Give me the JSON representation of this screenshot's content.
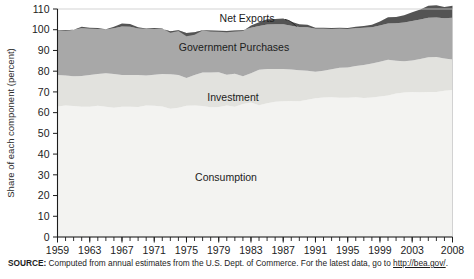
{
  "chart_data": {
    "type": "area",
    "title": "",
    "subtitle": "",
    "xlabel": "",
    "ylabel": "Share of each component (percent)",
    "ylim": [
      0,
      110
    ],
    "yticks": [
      0,
      10,
      20,
      30,
      40,
      50,
      60,
      70,
      80,
      90,
      100,
      110
    ],
    "xlim": [
      1959,
      2008
    ],
    "xticks": [
      1959,
      1963,
      1967,
      1971,
      1975,
      1979,
      1983,
      1987,
      1991,
      1995,
      1999,
      2003,
      2008
    ],
    "minor_tick_interval": 1,
    "grid": false,
    "legend_position": "inline-labels",
    "stacked": true,
    "annotations": [
      {
        "text": "Net Exports",
        "series": "Net Exports"
      },
      {
        "text": "Government Purchases",
        "series": "Government Purchases"
      },
      {
        "text": "Investment",
        "series": "Investment"
      },
      {
        "text": "Consumption",
        "series": "Consumption"
      }
    ],
    "x": [
      1959,
      1960,
      1961,
      1962,
      1963,
      1964,
      1965,
      1966,
      1967,
      1968,
      1969,
      1970,
      1971,
      1972,
      1973,
      1974,
      1975,
      1976,
      1977,
      1978,
      1979,
      1980,
      1981,
      1982,
      1983,
      1984,
      1985,
      1986,
      1987,
      1988,
      1989,
      1990,
      1991,
      1992,
      1993,
      1994,
      1995,
      1996,
      1997,
      1998,
      1999,
      2000,
      2001,
      2002,
      2003,
      2004,
      2005,
      2006,
      2007,
      2008
    ],
    "series": [
      {
        "name": "Consumption",
        "color": "#f3f3f1",
        "values": [
          63.0,
          63.4,
          63.2,
          62.8,
          62.9,
          63.3,
          62.8,
          62.3,
          62.8,
          62.9,
          62.7,
          63.4,
          63.3,
          63.0,
          61.9,
          62.3,
          63.3,
          63.5,
          63.2,
          62.6,
          62.7,
          63.4,
          62.8,
          64.2,
          64.9,
          63.6,
          64.5,
          65.3,
          65.5,
          65.6,
          65.5,
          66.2,
          67.0,
          67.3,
          67.4,
          67.2,
          67.2,
          67.4,
          67.1,
          67.3,
          67.8,
          68.3,
          69.2,
          69.7,
          69.9,
          69.8,
          69.9,
          69.9,
          70.5,
          70.9
        ]
      },
      {
        "name": "Investment",
        "color": "#e2e2de",
        "values": [
          15.2,
          14.5,
          14.3,
          14.9,
          15.2,
          15.4,
          16.2,
          16.4,
          15.4,
          15.3,
          15.5,
          14.5,
          15.0,
          15.7,
          16.6,
          15.8,
          13.4,
          14.6,
          16.2,
          16.8,
          16.8,
          14.9,
          16.0,
          13.4,
          14.1,
          17.1,
          16.5,
          15.8,
          15.6,
          15.2,
          15.0,
          14.0,
          12.7,
          12.9,
          13.5,
          14.4,
          14.6,
          15.1,
          15.9,
          16.4,
          16.7,
          17.2,
          15.8,
          15.1,
          15.3,
          16.1,
          16.8,
          16.9,
          15.6,
          14.7
        ]
      },
      {
        "name": "Government Purchases",
        "color": "#a8a8a8",
        "values": [
          21.6,
          21.8,
          22.5,
          23.0,
          22.4,
          21.7,
          21.1,
          22.0,
          23.3,
          23.2,
          22.4,
          22.4,
          22.1,
          21.6,
          20.8,
          21.6,
          21.7,
          20.7,
          20.4,
          20.2,
          20.0,
          21.1,
          20.8,
          22.1,
          22.0,
          21.1,
          21.5,
          21.5,
          21.6,
          21.1,
          20.8,
          21.0,
          20.8,
          20.3,
          19.5,
          18.9,
          18.6,
          18.2,
          17.9,
          17.5,
          17.5,
          17.5,
          18.1,
          18.7,
          19.0,
          19.0,
          19.1,
          19.1,
          19.4,
          20.2
        ]
      },
      {
        "name": "Net Exports",
        "color": "#545454",
        "values": [
          0.2,
          0.3,
          0.0,
          -0.7,
          -0.5,
          -0.4,
          -0.1,
          -0.7,
          -1.5,
          -1.4,
          -0.6,
          -0.3,
          -0.4,
          -0.3,
          0.7,
          0.3,
          1.6,
          1.2,
          0.2,
          0.4,
          0.5,
          0.6,
          0.4,
          0.3,
          -1.0,
          -1.8,
          -2.5,
          -2.6,
          -2.7,
          -1.9,
          -1.3,
          -1.2,
          -0.5,
          -0.5,
          -0.4,
          -0.5,
          -0.4,
          -0.7,
          -0.9,
          -1.2,
          -2.0,
          -3.0,
          -3.1,
          -3.5,
          -4.2,
          -4.9,
          -5.8,
          -5.9,
          -5.5,
          -5.8
        ]
      }
    ]
  },
  "source": {
    "label": "SOURCE:",
    "text_before": "Computed from annual estimates from the U.S. Dept. of Commerce. For the latest data, go to",
    "link": "http://bea.gov/",
    "text_after": "."
  },
  "colors": {
    "consumption": "#f3f3f1",
    "investment": "#e2e2de",
    "government": "#a8a8a8",
    "net_exports": "#545454",
    "axis": "#1c1c1c",
    "background": "#ffffff"
  }
}
